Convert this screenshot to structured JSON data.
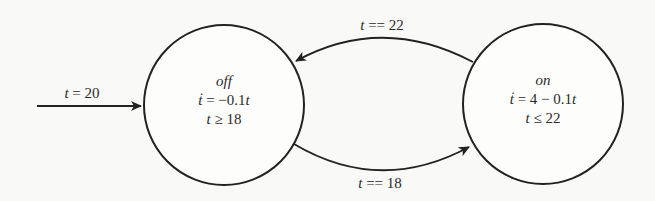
{
  "diagram": {
    "type": "hybrid-automaton",
    "colors": {
      "background": "#f9f9f8",
      "stroke": "#222222",
      "text": "#2a2a2a"
    },
    "initial": {
      "label_var": "t",
      "label_op": " = ",
      "label_val": "20",
      "target": "off"
    },
    "states": {
      "off": {
        "name": "off",
        "flow_var": "ṫ",
        "flow_rhs": " = −0.1",
        "flow_tail": "t",
        "invariant_var": "t",
        "invariant_rhs": " ≥ 18"
      },
      "on": {
        "name": "on",
        "flow_var": "ṫ",
        "flow_rhs": " = 4 − 0.1",
        "flow_tail": "t",
        "invariant_var": "t",
        "invariant_rhs": " ≤ 22"
      }
    },
    "transitions": {
      "on_to_off": {
        "from": "on",
        "to": "off",
        "guard_var": "t",
        "guard_rhs": " == 22"
      },
      "off_to_on": {
        "from": "off",
        "to": "on",
        "guard_var": "t",
        "guard_rhs": " == 18"
      }
    }
  }
}
